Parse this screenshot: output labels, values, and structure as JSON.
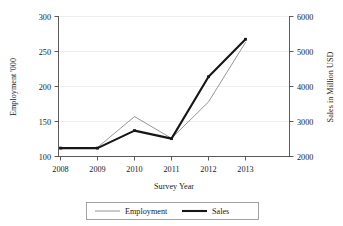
{
  "chart_data": {
    "type": "line",
    "title": "",
    "subtitle": "",
    "xlabel": "Survey Year",
    "ylabel": "Employment '000",
    "y2label": "Sales in Million USD",
    "categories": [
      "2008",
      "2009",
      "2010",
      "2011",
      "2012",
      "2013"
    ],
    "x": [
      2008,
      2009,
      2010,
      2011,
      2012,
      2013
    ],
    "xlim": [
      2008,
      2013
    ],
    "ylim": [
      100,
      300
    ],
    "y2lim": [
      2000,
      6000
    ],
    "yticks": [
      100,
      150,
      200,
      250,
      300
    ],
    "y2ticks": [
      2000,
      3000,
      4000,
      5000,
      6000
    ],
    "grid": true,
    "grid_axis": "y",
    "legend_position": "bottom",
    "series": [
      {
        "name": "Employment",
        "axis": "left",
        "unit": "'000",
        "color": "#8a8a8a",
        "line_width": "thin",
        "markers": false,
        "values": [
          112,
          113,
          157,
          126,
          178,
          263
        ]
      },
      {
        "name": "Sales",
        "axis": "right",
        "unit": "Million USD",
        "color": "#161616",
        "line_width": "thick",
        "markers": true,
        "values": [
          2240,
          2240,
          2740,
          2510,
          4280,
          5350
        ]
      }
    ]
  },
  "axes": {
    "left": {
      "label": "Employment '000",
      "ticks": [
        "100",
        "150",
        "200",
        "250",
        "300"
      ]
    },
    "right": {
      "label": "Sales in Million USD",
      "ticks": [
        "2000",
        "3000",
        "4000",
        "5000",
        "6000"
      ]
    },
    "bottom": {
      "label": "Survey Year",
      "ticks": [
        "2008",
        "2009",
        "2010",
        "2011",
        "2012",
        "2013"
      ]
    }
  },
  "legend": {
    "items": [
      {
        "label": "Employment",
        "style": "thin-gray-line"
      },
      {
        "label": "Sales",
        "style": "thick-black-line"
      }
    ]
  },
  "colors": {
    "employment_line": "#8a8a8a",
    "sales_line": "#161616",
    "gridline": "#e6e6e6",
    "axis": "#4a4a4a",
    "background": "#ffffff",
    "text": "#1a1a1a"
  }
}
